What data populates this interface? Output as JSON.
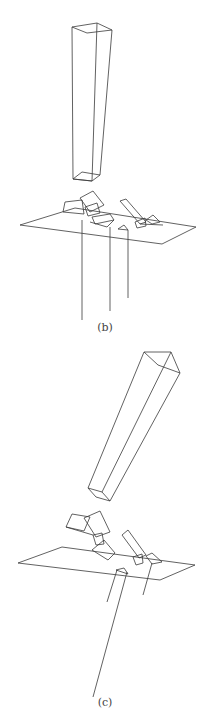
{
  "figure": {
    "panels": [
      {
        "id": "b",
        "caption": "(b)",
        "description": "3D wireframe: tall vertical prism above a ground plane with small prism fragments and three vertical line segments hanging below"
      },
      {
        "id": "c",
        "caption": "(c)",
        "description": "3D wireframe: tilted prism above a ground plane with clustered prism fragments and slanted line segments below"
      }
    ],
    "stroke_color": "#3a3a3a",
    "background": "#ffffff"
  }
}
